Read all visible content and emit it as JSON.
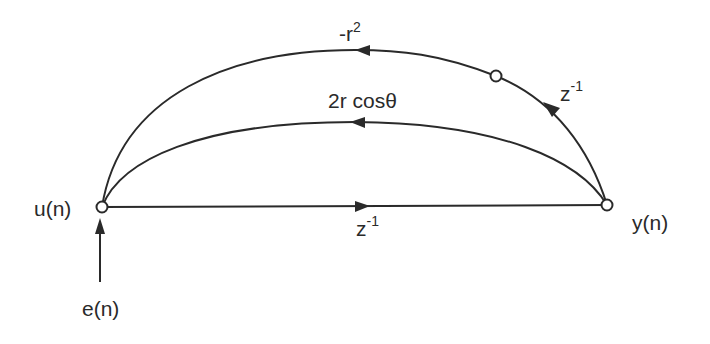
{
  "diagram": {
    "type": "signal-flow-graph",
    "nodes": {
      "input": {
        "label": "u(n)",
        "x": 102,
        "y": 207
      },
      "output": {
        "label": "y(n)",
        "x": 607,
        "y": 205
      },
      "delay_node": {
        "label": "",
        "x": 496,
        "y": 76
      }
    },
    "source": {
      "label": "e(n)"
    },
    "edges": {
      "outer_gain": {
        "base": "-r",
        "sup": "2"
      },
      "inner_gain": {
        "text": "2r cosθ"
      },
      "outer_delay": {
        "base": "z",
        "sup": "-1"
      },
      "forward_delay": {
        "base": "z",
        "sup": "-1"
      }
    },
    "colors": {
      "stroke": "#2a2a2a",
      "background": "#ffffff"
    }
  }
}
